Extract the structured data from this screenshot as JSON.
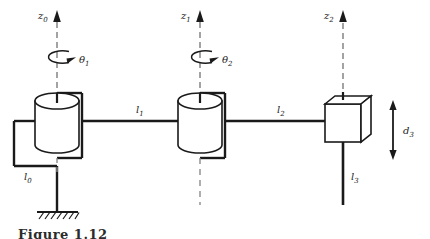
{
  "figure": {
    "kind": "robot-kinematic-diagram",
    "mechanism": "SCARA manipulator: revolute-revolute-prismatic (RRP)",
    "background_color": "#ffffff",
    "line_color": "#1a1a1a",
    "caption": "Figure 1.12"
  },
  "axes": [
    {
      "id": "z0",
      "label": "z",
      "subscript": "0",
      "x": 57,
      "arrow_tip_y": 12,
      "dash_bottom_y": 108,
      "label_x": 40,
      "label_y": 14
    },
    {
      "id": "z1",
      "label": "z",
      "subscript": "1",
      "x": 200,
      "arrow_tip_y": 12,
      "dash_bottom_y": 108,
      "label_x": 184,
      "label_y": 14
    },
    {
      "id": "z2",
      "label": "z",
      "subscript": "2",
      "x": 343,
      "arrow_tip_y": 12,
      "dash_bottom_y": 95,
      "label_x": 327,
      "label_y": 14
    }
  ],
  "joint_variables": [
    {
      "id": "theta1",
      "label": "θ",
      "subscript": "1",
      "type": "revolute",
      "about_axis": "z0",
      "label_x": 78,
      "label_y": 61
    },
    {
      "id": "theta2",
      "label": "θ",
      "subscript": "2",
      "type": "revolute",
      "about_axis": "z1",
      "label_x": 221,
      "label_y": 61
    },
    {
      "id": "d3",
      "label": "d",
      "subscript": "3",
      "type": "prismatic",
      "along_axis": "z2",
      "label_x": 405,
      "label_y": 133
    }
  ],
  "links": [
    {
      "id": "l0",
      "label": "l",
      "subscript": "0",
      "description": "base riser link to ground",
      "label_x": 23,
      "label_y": 178
    },
    {
      "id": "l1",
      "label": "l",
      "subscript": "1",
      "description": "first horizontal link",
      "label_x": 136,
      "label_y": 112
    },
    {
      "id": "l2",
      "label": "l",
      "subscript": "2",
      "description": "second horizontal link",
      "label_x": 277,
      "label_y": 112
    },
    {
      "id": "l3",
      "label": "l",
      "subscript": "3",
      "description": "prismatic end-effector shaft",
      "label_x": 351,
      "label_y": 178
    }
  ],
  "joint_bodies": [
    {
      "id": "joint1-cylinder",
      "type": "revolute-cylinder",
      "center_x": 57,
      "top_y": 95,
      "bottom_y": 152
    },
    {
      "id": "joint2-cylinder",
      "type": "revolute-cylinder",
      "center_x": 200,
      "top_y": 95,
      "bottom_y": 152
    },
    {
      "id": "joint3-cube",
      "type": "prismatic-cube",
      "center_x": 343,
      "top_y": 99,
      "bottom_y": 142
    }
  ],
  "ground": {
    "id": "ground-support",
    "x": 57,
    "y": 212,
    "width": 40,
    "hatch_count": 7
  }
}
